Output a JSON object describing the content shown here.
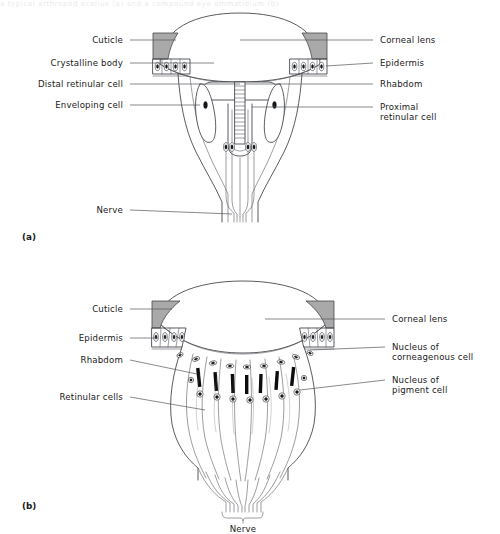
{
  "figure": {
    "top_partial_caption": "a typical arthropod ocellus (a) and a compound eye ommatidium (b)",
    "panels": [
      {
        "tag": "(a)",
        "type": "ocellus",
        "labels_left": [
          {
            "name": "cuticle",
            "text": "Cuticle"
          },
          {
            "name": "crystalline-body",
            "text": "Crystalline body"
          },
          {
            "name": "distal-retinular-cell",
            "text": "Distal retinular cell"
          },
          {
            "name": "enveloping-cell",
            "text": "Enveloping cell"
          },
          {
            "name": "nerve",
            "text": "Nerve"
          }
        ],
        "labels_right": [
          {
            "name": "corneal-lens",
            "text": "Corneal lens"
          },
          {
            "name": "epidermis",
            "text": "Epidermis"
          },
          {
            "name": "rhabdom",
            "text": "Rhabdom"
          },
          {
            "name": "proximal-retinular-cell",
            "text": "Proximal",
            "text2": "retinular cell"
          }
        ]
      },
      {
        "tag": "(b)",
        "type": "ommatidium",
        "labels_left": [
          {
            "name": "cuticle",
            "text": "Cuticle"
          },
          {
            "name": "epidermis",
            "text": "Epidermis"
          },
          {
            "name": "rhabdom",
            "text": "Rhabdom"
          },
          {
            "name": "retinular-cells",
            "text": "Retinular cells"
          }
        ],
        "labels_right": [
          {
            "name": "corneal-lens",
            "text": "Corneal lens"
          },
          {
            "name": "nucleus-of-corneagenous-cell",
            "text": "Nucleus of",
            "text2": "corneagenous cell"
          },
          {
            "name": "nucleus-of-pigment-cell",
            "text": "Nucleus of",
            "text2": "pigment cell"
          }
        ],
        "labels_bottom": [
          {
            "name": "nerve",
            "text": "Nerve"
          }
        ]
      }
    ],
    "colors": {
      "cuticle_gray": "#a9a9a9",
      "outline": "#3c3f44",
      "leader": "#55585c",
      "rhabdom_black": "#0b0c0d",
      "background": "#ffffff"
    }
  }
}
